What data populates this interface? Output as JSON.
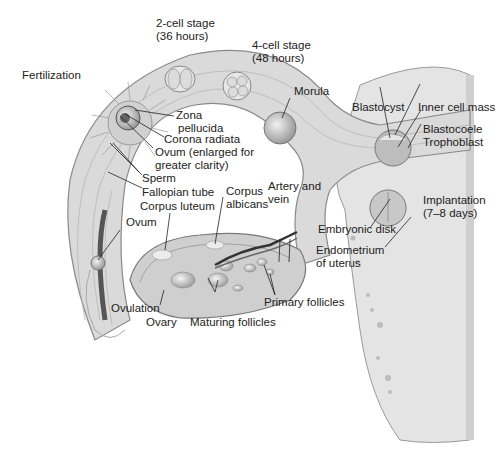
{
  "diagram": {
    "type": "anatomical-illustration",
    "labels": {
      "stage_2cell": "2-cell stage",
      "stage_2cell_time": "(36 hours)",
      "stage_4cell": "4-cell stage",
      "stage_4cell_time": "(48 hours)",
      "fertilization": "Fertilization",
      "morula": "Morula",
      "blastocyst": "Blastocyst",
      "inner_cell_mass": "Inner cell mass",
      "blastocoele": "Blastocoele",
      "trophoblast": "Trophoblast",
      "zona_1": "Zona",
      "zona_2": "pellucida",
      "corona_radiata": "Corona radiata",
      "ovum_enlarged_1": "Ovum (enlarged for",
      "ovum_enlarged_2": "greater clarity)",
      "sperm": "Sperm",
      "fallopian_tube": "Fallopian tube",
      "corpus_luteum": "Corpus luteum",
      "corpus_albicans_1": "Corpus",
      "corpus_albicans_2": "albicans",
      "artery_vein_1": "Artery and",
      "artery_vein_2": "vein",
      "ovum": "Ovum",
      "implantation": "Implantation",
      "implantation_time": "(7–8 days)",
      "embryonic_disk": "Embryonic disk",
      "endometrium_1": "Endometrium",
      "endometrium_2": "of uterus",
      "primary_follicles": "Primary follicles",
      "ovulation": "Ovulation",
      "ovary": "Ovary",
      "maturing_follicles": "Maturing follicles"
    },
    "colors": {
      "background": "#ffffff",
      "tissue": "#d9d9d9",
      "tissue_dark": "#a8a8a8",
      "outline": "#7a7a7a",
      "text": "#222222"
    }
  }
}
